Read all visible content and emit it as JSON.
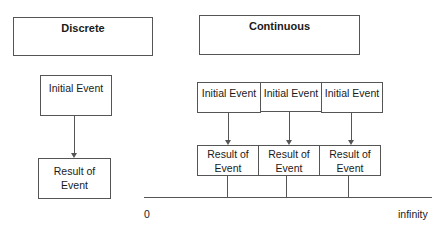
{
  "discrete": {
    "title": "Discrete",
    "initial_event": "Initial Event",
    "result_line1": "Result of",
    "result_line2": "Event"
  },
  "continuous": {
    "title": "Continuous",
    "initial_events": [
      "Initial Event",
      "Initial Event",
      "Initial Event"
    ],
    "results": [
      {
        "line1": "Result of",
        "line2": "Event"
      },
      {
        "line1": "Result of",
        "line2": "Event"
      },
      {
        "line1": "Result of",
        "line2": "Event"
      }
    ]
  },
  "timeline": {
    "start_label": "0",
    "end_label": "infinity"
  }
}
